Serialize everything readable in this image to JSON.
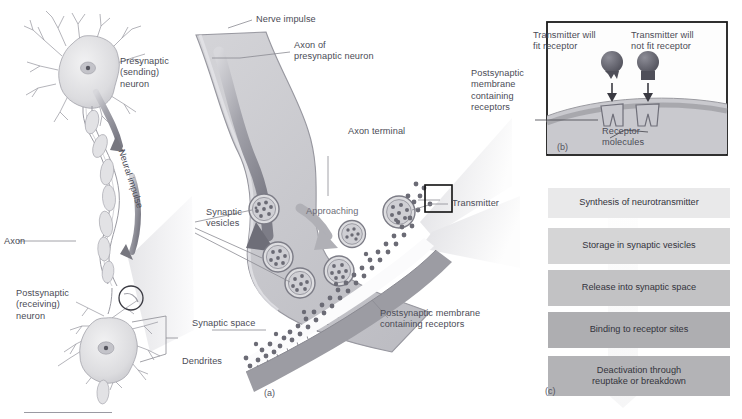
{
  "figure": {
    "panels": [
      {
        "tag": "(a)",
        "name": "synapse-overview"
      },
      {
        "tag": "(b)",
        "name": "receptor-fit-inset"
      },
      {
        "tag": "(c)",
        "name": "neurotransmitter-lifecycle-flowchart"
      }
    ]
  },
  "panel_a": {
    "tag": "(a)",
    "labels": {
      "presynaptic_neuron": "Presynaptic\n(sending)\nneuron",
      "axon": "Axon",
      "neural_impulse": "Neural impulse",
      "postsynaptic_neuron": "Postsynaptic\n(receiving)\nneuron",
      "dendrites": "Dendrites",
      "nerve_impulse": "Nerve impulse",
      "axon_of_presynaptic_neuron": "Axon of\npresynaptic neuron",
      "axon_terminal": "Axon terminal",
      "synaptic_vesicles": "Synaptic\nvesicles",
      "approaching": "Approaching",
      "transmitter": "Transmitter",
      "synaptic_space": "Synaptic space",
      "postsynaptic_membrane": "Postsynaptic membrane\ncontaining receptors"
    }
  },
  "panel_b": {
    "tag": "(b)",
    "labels": {
      "transmitter_will_fit": "Transmitter will\nfit receptor",
      "transmitter_will_not_fit": "Transmitter will\nnot fit receptor",
      "postsynaptic_membrane": "Postsynaptic\nmembrane\ncontaining\nreceptors",
      "receptor_molecules": "Receptor\nmolecules"
    }
  },
  "panel_c": {
    "tag": "(c)",
    "steps": [
      {
        "label": "Synthesis of neurotransmitter",
        "shade": "#e9e9ea"
      },
      {
        "label": "Storage in synaptic vesicles",
        "shade": "#d5d5d6"
      },
      {
        "label": "Release into synaptic space",
        "shade": "#c2c2c4"
      },
      {
        "label": "Binding to receptor sites",
        "shade": "#aeaeb1"
      },
      {
        "label": "Deactivation through\nreuptake or breakdown",
        "shade": "#b3b3b6"
      }
    ]
  },
  "colors": {
    "text": "#4b4b56",
    "cell_fill": "#d9d9dc",
    "terminal_fill": "#c9c9cd",
    "membrane": "#9a9aa0",
    "transmitter_dot": "#6b6b75",
    "outline": "#8a8a92",
    "inset_border": "#1a1a1a"
  }
}
